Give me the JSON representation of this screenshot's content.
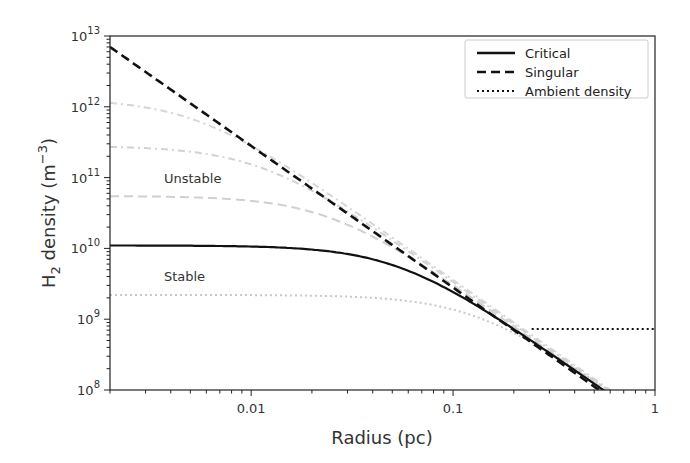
{
  "chart_data": {
    "type": "line",
    "title": "",
    "xlabel": "Radius (pc)",
    "ylabel": "H2 density (m^-3)",
    "xscale": "log",
    "yscale": "log",
    "xlim": [
      0.002,
      1
    ],
    "ylim": [
      100000000.0,
      10000000000000.0
    ],
    "grid": false,
    "legend_position": "upper right",
    "x_ticks": [
      {
        "value": 0.01,
        "label": "0.01"
      },
      {
        "value": 0.1,
        "label": "0.1"
      },
      {
        "value": 1,
        "label": "1"
      }
    ],
    "y_ticks": [
      {
        "value": 100000000.0,
        "base": "10",
        "exp": "8"
      },
      {
        "value": 1000000000.0,
        "base": "10",
        "exp": "9"
      },
      {
        "value": 10000000000.0,
        "base": "10",
        "exp": "10"
      },
      {
        "value": 100000000000.0,
        "base": "10",
        "exp": "11"
      },
      {
        "value": 1000000000000.0,
        "base": "10",
        "exp": "12"
      },
      {
        "value": 10000000000000.0,
        "base": "10",
        "exp": "13"
      }
    ],
    "legend": [
      {
        "label": "Critical",
        "style": "solid",
        "color": "#111111"
      },
      {
        "label": "Singular",
        "style": "dashed",
        "color": "#111111"
      },
      {
        "label": "Ambient density",
        "style": "dotted",
        "color": "#111111"
      }
    ],
    "annotations": [
      {
        "text": "Unstable",
        "r": 0.0037,
        "n": 85000000000.0
      },
      {
        "text": "Stable",
        "r": 0.0037,
        "n": 3500000000.0
      }
    ],
    "series": [
      {
        "name": "Singular",
        "kind": "singular",
        "style": "dashed",
        "color": "#111111",
        "width": 2.6,
        "A": 28000000.0
      },
      {
        "name": "Critical",
        "kind": "be",
        "style": "solid",
        "color": "#111111",
        "width": 2.2,
        "nc": 11000000000.0,
        "A": 31000000.0
      },
      {
        "name": "Ambient density",
        "kind": "ambient",
        "style": "dotted",
        "color": "#111111",
        "width": 2,
        "n": 730000000.0,
        "r_start": 0.245,
        "r_end": 1
      },
      {
        "name": "Unstable 1",
        "kind": "be",
        "style": "dashdot",
        "color": "#d6d6d6",
        "width": 2,
        "nc": 1300000000000.0,
        "A": 36000000.0
      },
      {
        "name": "Unstable 2",
        "kind": "be",
        "style": "dashdot",
        "color": "#d2d2d2",
        "width": 2,
        "nc": 280000000000.0,
        "A": 34000000.0
      },
      {
        "name": "Unstable 3",
        "kind": "be",
        "style": "dashed",
        "color": "#d0d0d0",
        "width": 2,
        "nc": 55000000000.0,
        "A": 32000000.0
      },
      {
        "name": "Stable",
        "kind": "be",
        "style": "dotted",
        "color": "#c8c8c8",
        "width": 2,
        "nc": 2200000000.0,
        "A": 36000000.0
      }
    ]
  }
}
